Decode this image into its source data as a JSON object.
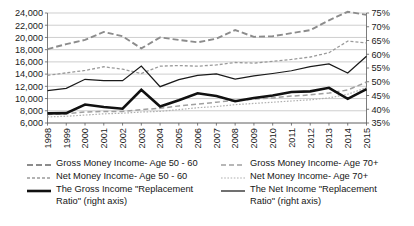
{
  "chart_data": {
    "type": "line",
    "title": "",
    "subtitle": "",
    "xlabel": "",
    "ylabel": "",
    "y2label": "",
    "grid": true,
    "legend_position": "bottom",
    "x": [
      "1998",
      "1999",
      "2000",
      "2001",
      "2002",
      "2003",
      "2004",
      "2005",
      "2006",
      "2007",
      "2008",
      "2009",
      "2010",
      "2011",
      "2012",
      "2013",
      "2014",
      "2015"
    ],
    "categories": [
      "1998",
      "1999",
      "2000",
      "2001",
      "2002",
      "2003",
      "2004",
      "2005",
      "2006",
      "2007",
      "2008",
      "2009",
      "2010",
      "2011",
      "2012",
      "2013",
      "2014",
      "2015"
    ],
    "ylim": [
      6000,
      24000
    ],
    "ytick_step": 2000,
    "yticks": [
      "6,000",
      "8,000",
      "10,000",
      "12,000",
      "14,000",
      "16,000",
      "18,000",
      "20,000",
      "22,000",
      "24,000"
    ],
    "ytick_values": [
      6000,
      8000,
      10000,
      12000,
      14000,
      16000,
      18000,
      20000,
      22000,
      24000
    ],
    "y2lim": [
      35,
      75
    ],
    "y2tick_step": 5,
    "y2ticks": [
      "35%",
      "40%",
      "45%",
      "50%",
      "55%",
      "60%",
      "65%",
      "70%",
      "75%"
    ],
    "y2tick_values": [
      35,
      40,
      45,
      50,
      55,
      60,
      65,
      70,
      75
    ],
    "series": [
      {
        "name": "Gross Money Income- Age 50 - 60",
        "axis": "left",
        "style": "dashed",
        "color": "#8c8c8c",
        "width": 1.9,
        "dash": "6,3",
        "values": [
          18100,
          18900,
          19600,
          20900,
          20200,
          18200,
          20000,
          19600,
          19200,
          19800,
          21200,
          20100,
          20200,
          20700,
          21200,
          22800,
          24200,
          23700
        ]
      },
      {
        "name": "Net Money Income- Age 50 - 60",
        "axis": "left",
        "style": "dotted",
        "color": "#9a9a9a",
        "width": 1.3,
        "dash": "3,2",
        "values": [
          13800,
          14200,
          14600,
          15200,
          14800,
          14100,
          15300,
          15400,
          15300,
          15500,
          15900,
          15800,
          16100,
          16400,
          16800,
          17500,
          19400,
          19100
        ]
      },
      {
        "name": "Gross Money Income- Age 70+",
        "axis": "left",
        "style": "dashed",
        "color": "#a0a0a0",
        "width": 1.5,
        "dash": "5,3",
        "values": [
          7400,
          7500,
          7800,
          7900,
          7900,
          8200,
          8400,
          8800,
          9100,
          9400,
          9700,
          9900,
          10100,
          10400,
          10600,
          10900,
          11400,
          12700
        ]
      },
      {
        "name": "Net Money Income- Age 70+",
        "axis": "left",
        "style": "fine-dotted",
        "color": "#b0b0b0",
        "width": 1.2,
        "dash": "1.6,1.6",
        "values": [
          7000,
          7100,
          7300,
          7500,
          7600,
          7800,
          7900,
          8200,
          8500,
          8700,
          9000,
          9200,
          9400,
          9600,
          9800,
          10100,
          10700,
          11800
        ]
      },
      {
        "name": "The Gross Income \"Replacement Ratio\" (right axis)",
        "axis": "right",
        "style": "solid-thick",
        "color": "#111111",
        "width": 2.6,
        "dash": "",
        "values": [
          38.5,
          38.6,
          41.7,
          40.8,
          40.2,
          47.1,
          41.0,
          43.3,
          45.8,
          44.8,
          42.9,
          44.1,
          45.0,
          46.3,
          46.5,
          47.8,
          43.8,
          47.3
        ]
      },
      {
        "name": "The Net Income \"Replacement Ratio\" (right axis)",
        "axis": "right",
        "style": "solid-thin",
        "color": "#1a1a1a",
        "width": 1.25,
        "dash": "",
        "values": [
          46.8,
          47.6,
          50.9,
          50.4,
          50.4,
          55.7,
          48.2,
          50.8,
          52.3,
          52.9,
          51.0,
          52.1,
          53.0,
          54.0,
          55.5,
          56.5,
          53.2,
          59.3
        ]
      }
    ]
  },
  "axes": {
    "left_ticks": [
      "24,000",
      "22,000",
      "20,000",
      "18,000",
      "16,000",
      "14,000",
      "12,000",
      "10,000",
      "8,000",
      "6,000"
    ],
    "right_ticks": [
      "75%",
      "70%",
      "65%",
      "60%",
      "55%",
      "50%",
      "45%",
      "40%",
      "35%"
    ],
    "x_ticks": [
      "1998",
      "1999",
      "2000",
      "2001",
      "2002",
      "2003",
      "2004",
      "2005",
      "2006",
      "2007",
      "2008",
      "2009",
      "2010",
      "2011",
      "2012",
      "2013",
      "2014",
      "2015"
    ]
  },
  "legend": {
    "columns": [
      {
        "items": [
          {
            "label": "Gross Money Income- Age 50 - 60",
            "icon": "dashed-line-swatch",
            "series_index": 0
          },
          {
            "label": "Net Money Income- Age 50 - 60",
            "icon": "dotted-line-swatch",
            "series_index": 1
          },
          {
            "label": "The Gross Income \"Replacement\nRatio\" (right axis)",
            "icon": "solid-thick-line-swatch",
            "series_index": 4
          }
        ]
      },
      {
        "items": [
          {
            "label": "Gross Money Income- Age 70+",
            "icon": "dashed-line-swatch",
            "series_index": 2
          },
          {
            "label": "Net Money Income- Age 70+",
            "icon": "fine-dotted-line-swatch",
            "series_index": 3
          },
          {
            "label": "The Net Income \"Replacement\nRatio\" (right axis)",
            "icon": "solid-thin-line-swatch",
            "series_index": 5
          }
        ]
      }
    ]
  }
}
